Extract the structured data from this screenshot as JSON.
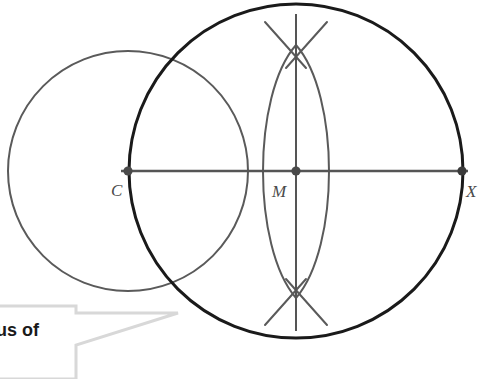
{
  "figure": {
    "type": "geometry-construction-diagram",
    "background_color": "#ffffff",
    "stroke_colors": {
      "main_circle": "#1a1a1a",
      "secondary_circle": "#555555",
      "construction_arc": "#5a5a5a",
      "line": "#555555",
      "point_dot": "#4a4a4a",
      "callout_border": "#d8d8d8",
      "label_text": "#4a4a4a",
      "callout_text": "#1a1a1a"
    },
    "points": [
      {
        "id": "C",
        "label": "C",
        "cx": 128,
        "cy": 171,
        "label_x": 111,
        "label_y": 182,
        "role": "center-of-small-circle"
      },
      {
        "id": "M",
        "label": "M",
        "cx": 296,
        "cy": 171,
        "label_x": 272,
        "label_y": 183,
        "role": "center-of-large-circle"
      },
      {
        "id": "X",
        "label": "X",
        "cx": 462,
        "cy": 171,
        "label_x": 466,
        "label_y": 183,
        "role": "point-on-large-circle"
      }
    ],
    "circles": [
      {
        "id": "large-circle",
        "cx": 296,
        "cy": 171,
        "r": 167,
        "stroke": "#1a1a1a",
        "stroke_width": 3.0
      },
      {
        "id": "small-circle",
        "cx": 128,
        "cy": 171,
        "r": 120,
        "stroke": "#5a5a5a",
        "stroke_width": 2.0
      }
    ],
    "lines": [
      {
        "id": "horizontal-diameter-CX",
        "x1": 121,
        "y1": 171,
        "x2": 468,
        "y2": 171,
        "stroke": "#555555",
        "stroke_width": 2.4
      },
      {
        "id": "vertical-perpendicular-bisector",
        "x1": 296,
        "y1": 14,
        "x2": 296,
        "y2": 331,
        "stroke": "#555555",
        "stroke_width": 2.0
      }
    ],
    "arcs": [
      {
        "id": "arc-left-lens",
        "d": "M 296 45 C 252 95 252 247 296 298",
        "stroke": "#5a5a5a",
        "stroke_width": 2.0
      },
      {
        "id": "arc-right-lens",
        "d": "M 296 45 C 340 95 340 247 296 298",
        "stroke": "#5a5a5a",
        "stroke_width": 2.0
      },
      {
        "id": "arc-top-left-tick",
        "d": "M 265 22 L 306 68",
        "stroke": "#5a5a5a",
        "stroke_width": 2.0
      },
      {
        "id": "arc-top-right-tick",
        "d": "M 327 22 L 286 68",
        "stroke": "#5a5a5a",
        "stroke_width": 2.0
      },
      {
        "id": "arc-bottom-left-tick",
        "d": "M 265 325 L 306 279",
        "stroke": "#5a5a5a",
        "stroke_width": 2.0
      },
      {
        "id": "arc-bottom-right-tick",
        "d": "M 327 325 L 286 279",
        "stroke": "#5a5a5a",
        "stroke_width": 2.0
      }
    ],
    "callout": {
      "text": "us of",
      "text_clipped": true,
      "box_path": "M -10 306 L 76 306 L 76 313 L 178 313 L 76 345 L 76 379 L -10 379 Z",
      "border_color": "#d8d8d8",
      "border_width": 3,
      "pointer_tip_x": 178,
      "pointer_tip_y": 313
    }
  }
}
